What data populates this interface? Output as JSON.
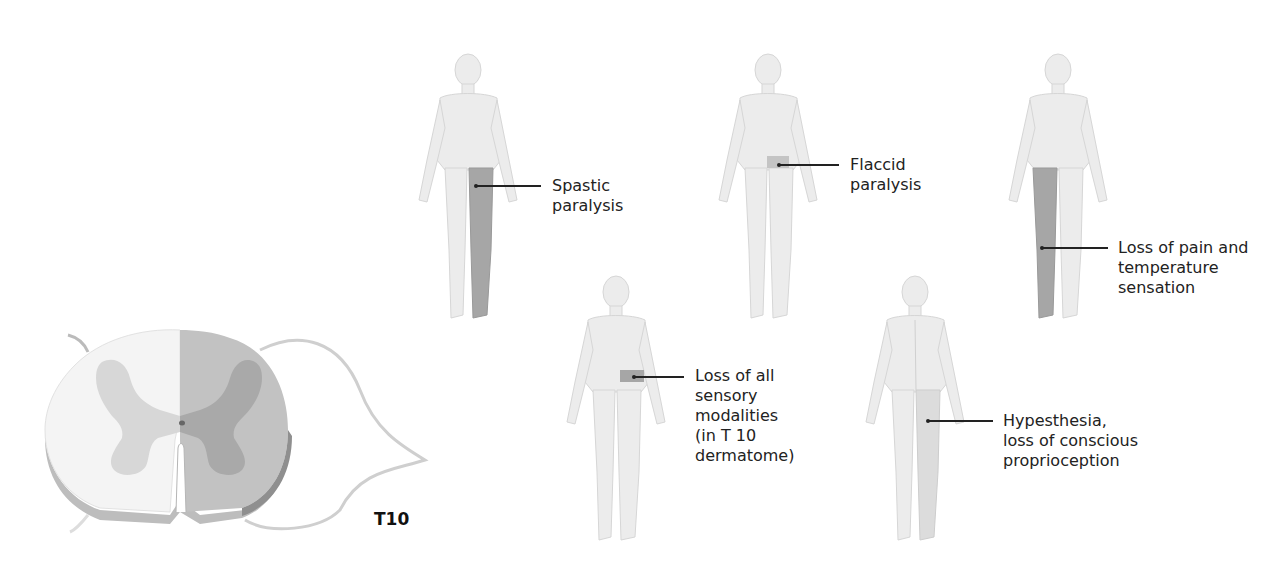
{
  "figure": {
    "cross_section": {
      "segment_label": "T10",
      "lesion_side": "right hemisection (shaded)",
      "colors": {
        "lesion_fill": "#bcbcbc",
        "gray_matter_lesion": "#a8a8a8",
        "gray_matter_normal": "#d9d9d9",
        "white_matter_normal": "#f5f5f5",
        "edge": "#9a9a9a"
      }
    },
    "figures": [
      {
        "id": "spastic",
        "label": "Spastic\nparalysis",
        "shaded_region": "ipsilateral leg (same side, below lesion)"
      },
      {
        "id": "flaccid",
        "label": "Flaccid\nparalysis",
        "shaded_region": "ipsilateral T10 band"
      },
      {
        "id": "pain-temp",
        "label": "Loss of pain and\ntemperature\nsensation",
        "shaded_region": "contralateral leg"
      },
      {
        "id": "all-sensory",
        "label": "Loss of all\nsensory\nmodalities\n(in T 10\ndermatome)",
        "shaded_region": "ipsilateral T10 dermatome band"
      },
      {
        "id": "hypesthesia",
        "label": "Hypesthesia,\nloss of conscious\nproprioception",
        "shaded_region": "ipsilateral leg (light)"
      }
    ],
    "colors": {
      "body": "#e9e9e9",
      "body_edge": "#cfcfcf",
      "shade": "#a6a6a6",
      "text": "#222222"
    }
  }
}
